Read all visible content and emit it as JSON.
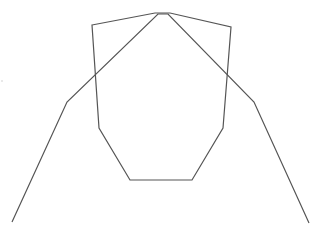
{
  "canvas": {
    "width": 326,
    "height": 234,
    "background": "#ffffff"
  },
  "shapes": {
    "octagon": {
      "label": "closed polygon (octagon-like)",
      "stroke": "#555555",
      "stroke_width": 1.2,
      "points": "92,25 155,13 170,13 231,27 223,128 192,180 130,180 99,128"
    },
    "outer_curve": {
      "label": "open polyline (arch)",
      "stroke": "#555555",
      "stroke_width": 1.2,
      "points": "12,222 67,102 158,14 168,14 254,102 309,223"
    },
    "speck": {
      "label": "faint artifact dot",
      "cx": 2,
      "cy": 81,
      "r": 0.8,
      "fill": "#cccccc"
    }
  }
}
